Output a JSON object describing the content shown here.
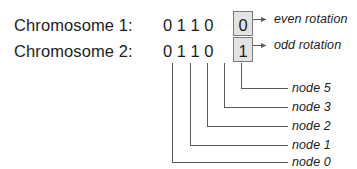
{
  "figure": {
    "rows": [
      {
        "label": "Chromosome 1:",
        "bits": "0 1 1 0",
        "boxed_bit": "0"
      },
      {
        "label": "Chromosome 2:",
        "bits": "0 1 1 0",
        "boxed_bit": "1"
      }
    ],
    "callouts": [
      {
        "text": "even rotation"
      },
      {
        "text": "odd rotation"
      }
    ],
    "node_labels": [
      {
        "text": "node 5"
      },
      {
        "text": "node 3"
      },
      {
        "text": "node 2"
      },
      {
        "text": "node 1"
      },
      {
        "text": "node 0"
      }
    ],
    "colors": {
      "ink": "#1d1d1d",
      "line": "#5a5a5a",
      "box_fill": "#e3e3e3",
      "box_border": "#7b7b7b",
      "background": "#ffffff"
    }
  }
}
